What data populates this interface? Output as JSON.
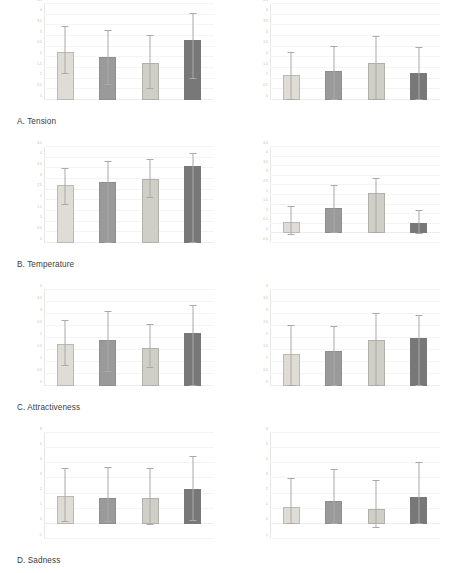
{
  "figure": {
    "title": "",
    "background": "#ffffff",
    "panel_label_color": "#3d3d3d",
    "tick_color": "#c9b9a6",
    "error_bar_color": "#a9a9a9"
  },
  "series_colors": [
    "#dedcd4",
    "#9a9a9a",
    "#cfcfc8",
    "#787878"
  ],
  "panels": [
    {
      "key": "a",
      "label": "A. Tension"
    },
    {
      "key": "b",
      "label": "B. Temperature"
    },
    {
      "key": "c",
      "label": "C. Attractiveness"
    },
    {
      "key": "d",
      "label": "D. Sadness"
    }
  ],
  "chart_data": [
    {
      "id": "a-left",
      "type": "bar",
      "title": "A. Tension",
      "panel": "A",
      "side": "left",
      "xlabel": "",
      "ylabel": "",
      "ylim": [
        0,
        4.5
      ],
      "yticks": [
        0,
        0.5,
        1,
        1.5,
        2,
        2.5,
        3,
        3.5,
        4,
        4.5
      ],
      "ytick_labels": [
        "0",
        "0.5",
        "1",
        "1.5",
        "2",
        "2.5",
        "3",
        "3.5",
        "4",
        "4.5"
      ],
      "grid": true,
      "legend": "none",
      "categories": [
        "1",
        "2",
        "3",
        "4"
      ],
      "values": [
        2.25,
        2.0,
        1.75,
        2.8
      ],
      "err_upper": [
        3.4,
        3.25,
        3.0,
        4.05
      ],
      "err_lower": [
        1.2,
        0.7,
        0.5,
        1.0
      ]
    },
    {
      "id": "a-right",
      "type": "bar",
      "title": "A. Tension",
      "panel": "A",
      "side": "right",
      "xlabel": "",
      "ylabel": "",
      "ylim": [
        0,
        4.5
      ],
      "yticks": [
        0,
        0.5,
        1,
        1.5,
        2,
        2.5,
        3,
        3.5,
        4,
        4.5
      ],
      "ytick_labels": [
        "0",
        "0.5",
        "1",
        "1.5",
        "2",
        "2.5",
        "3",
        "3.5",
        "4",
        "4.5"
      ],
      "grid": true,
      "legend": "none",
      "categories": [
        "1",
        "2",
        "3",
        "4"
      ],
      "values": [
        1.15,
        1.35,
        1.75,
        1.25
      ],
      "err_upper": [
        2.2,
        2.5,
        2.95,
        2.45
      ],
      "err_lower": [
        0.0,
        0.0,
        0.0,
        0.0
      ]
    },
    {
      "id": "b-left",
      "type": "bar",
      "title": "B. Temperature",
      "panel": "B",
      "side": "left",
      "xlabel": "",
      "ylabel": "",
      "ylim": [
        0,
        4.5
      ],
      "yticks": [
        0,
        0.5,
        1,
        1.5,
        2,
        2.5,
        3,
        3.5,
        4,
        4.5
      ],
      "ytick_labels": [
        "0",
        "0.5",
        "1",
        "1.5",
        "2",
        "2.5",
        "3",
        "3.5",
        "4",
        "4.5"
      ],
      "grid": true,
      "legend": "none",
      "categories": [
        "1",
        "2",
        "3",
        "4"
      ],
      "values": [
        2.7,
        2.85,
        3.0,
        3.6
      ],
      "err_upper": [
        3.45,
        3.8,
        3.9,
        4.15
      ],
      "err_lower": [
        1.8,
        0.0,
        2.1,
        0.0
      ]
    },
    {
      "id": "b-right",
      "type": "bar",
      "title": "B. Temperature",
      "panel": "B",
      "side": "right",
      "xlabel": "",
      "ylabel": "",
      "ylim": [
        -0.5,
        4.5
      ],
      "yticks": [
        -0.5,
        0,
        0.5,
        1,
        1.5,
        2,
        2.5,
        3,
        3.5,
        4,
        4.5
      ],
      "ytick_labels": [
        "-0.5",
        "0",
        "0.5",
        "1",
        "1.5",
        "2",
        "2.5",
        "3",
        "3.5",
        "4",
        "4.5"
      ],
      "grid": true,
      "legend": "none",
      "categories": [
        "1",
        "2",
        "3",
        "4"
      ],
      "values": [
        0.6,
        1.3,
        2.1,
        0.55
      ],
      "err_upper": [
        1.4,
        2.45,
        2.85,
        1.15
      ],
      "err_lower": [
        -0.1,
        0.0,
        0.0,
        -0.05
      ]
    },
    {
      "id": "c-left",
      "type": "bar",
      "title": "C. Attractiveness",
      "panel": "C",
      "side": "left",
      "xlabel": "",
      "ylabel": "",
      "ylim": [
        0,
        4
      ],
      "yticks": [
        0,
        0.5,
        1,
        1.5,
        2,
        2.5,
        3,
        3.5,
        4
      ],
      "ytick_labels": [
        "0",
        "0.5",
        "1",
        "1.5",
        "2",
        "2.5",
        "3",
        "3.5",
        "4"
      ],
      "grid": true,
      "legend": "none",
      "categories": [
        "1",
        "2",
        "3",
        "4"
      ],
      "values": [
        1.75,
        1.9,
        1.6,
        2.2
      ],
      "err_upper": [
        2.7,
        3.1,
        2.55,
        3.35
      ],
      "err_lower": [
        0.85,
        0.6,
        0.75,
        0.0
      ]
    },
    {
      "id": "c-right",
      "type": "bar",
      "title": "C. Attractiveness",
      "panel": "C",
      "side": "right",
      "xlabel": "",
      "ylabel": "",
      "ylim": [
        0,
        4
      ],
      "yticks": [
        0,
        0.5,
        1,
        1.5,
        2,
        2.5,
        3,
        3.5,
        4
      ],
      "ytick_labels": [
        "0",
        "0.5",
        "1",
        "1.5",
        "2",
        "2.5",
        "3",
        "3.5",
        "4"
      ],
      "grid": true,
      "legend": "none",
      "categories": [
        "1",
        "2",
        "3",
        "4"
      ],
      "values": [
        1.35,
        1.45,
        1.9,
        2.0
      ],
      "err_upper": [
        2.5,
        2.45,
        3.0,
        2.9
      ],
      "err_lower": [
        0.0,
        0.0,
        0.0,
        0.0
      ]
    },
    {
      "id": "d-left",
      "type": "bar",
      "title": "D. Sadness",
      "panel": "D",
      "side": "left",
      "xlabel": "",
      "ylabel": "",
      "ylim": [
        -1,
        6
      ],
      "yticks": [
        -1,
        0,
        1,
        2,
        3,
        4,
        5,
        6
      ],
      "ytick_labels": [
        "-1",
        "0",
        "1",
        "2",
        "3",
        "4",
        "5",
        "6"
      ],
      "grid": true,
      "legend": "none",
      "categories": [
        "1",
        "2",
        "3",
        "4"
      ],
      "values": [
        1.85,
        1.7,
        1.7,
        2.3
      ],
      "err_upper": [
        3.6,
        3.7,
        3.6,
        4.4
      ],
      "err_lower": [
        0.15,
        0.1,
        -0.1,
        0.2
      ]
    },
    {
      "id": "d-right",
      "type": "bar",
      "title": "D. Sadness",
      "panel": "D",
      "side": "right",
      "xlabel": "",
      "ylabel": "",
      "ylim": [
        -1,
        6
      ],
      "yticks": [
        -1,
        0,
        1,
        2,
        3,
        4,
        5,
        6
      ],
      "ytick_labels": [
        "-1",
        "0",
        "1",
        "2",
        "3",
        "4",
        "5",
        "6"
      ],
      "grid": true,
      "legend": "none",
      "categories": [
        "1",
        "2",
        "3",
        "4"
      ],
      "values": [
        1.1,
        1.5,
        1.0,
        1.8
      ],
      "err_upper": [
        2.95,
        3.55,
        2.85,
        4.05
      ],
      "err_lower": [
        0.0,
        0.0,
        -0.25,
        0.0
      ]
    }
  ]
}
